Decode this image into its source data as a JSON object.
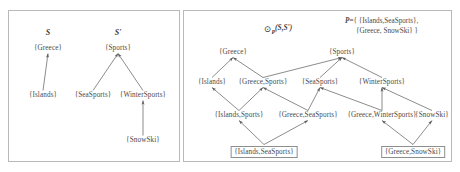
{
  "figure": {
    "type": "diagram",
    "left_panel": {
      "titles": [
        {
          "label": "S",
          "x": 48,
          "y": 28
        },
        {
          "label": "S'",
          "x": 118,
          "y": 28
        }
      ],
      "nodes": [
        {
          "id": "l-greece",
          "label": "{Greece}",
          "x": 48,
          "y": 45
        },
        {
          "id": "l-sports",
          "label": "{Sports}",
          "x": 118,
          "y": 45
        },
        {
          "id": "l-islands",
          "label": "{Islands}",
          "x": 43,
          "y": 92
        },
        {
          "id": "l-seasports",
          "label": "{SeaSports}",
          "x": 93,
          "y": 92
        },
        {
          "id": "l-wintersports",
          "label": "{WinterSports}",
          "x": 143,
          "y": 92
        },
        {
          "id": "l-snowski",
          "label": "{SnowSki}",
          "x": 143,
          "y": 137
        }
      ],
      "edges": [
        {
          "from": "l-islands",
          "to": "l-greece"
        },
        {
          "from": "l-seasports",
          "to": "l-sports"
        },
        {
          "from": "l-wintersports",
          "to": "l-sports"
        },
        {
          "from": "l-snowski",
          "to": "l-wintersports"
        }
      ]
    },
    "right_panel": {
      "operator": {
        "symbol": "⊙",
        "subscript": "P",
        "args": "(S,S')",
        "x": 278,
        "y": 23
      },
      "legend": {
        "name": "P",
        "equals": "=",
        "line1": "{ {Islands,SeaSports},",
        "line2": "{Greece, SnowSki} }",
        "x": 345,
        "y": 16
      },
      "nodes": [
        {
          "id": "r-greece",
          "label": "{Greece}",
          "x": 233,
          "y": 49,
          "boxed": false
        },
        {
          "id": "r-sports",
          "label": "{Sports}",
          "x": 342,
          "y": 49,
          "boxed": false
        },
        {
          "id": "r-islands",
          "label": "{Islands}",
          "x": 212,
          "y": 79,
          "boxed": false
        },
        {
          "id": "r-greece-sports",
          "label": "{Greece,Sports}",
          "x": 263,
          "y": 79,
          "boxed": false
        },
        {
          "id": "r-seasports",
          "label": "{SeaSports}",
          "x": 320,
          "y": 79,
          "boxed": false
        },
        {
          "id": "r-wintersports",
          "label": "{WinterSports}",
          "x": 382,
          "y": 79,
          "boxed": false
        },
        {
          "id": "r-islands-sports",
          "label": "{Islands,Sports}",
          "x": 239,
          "y": 112,
          "boxed": false
        },
        {
          "id": "r-greece-seasp",
          "label": "{Greece,SeaSports}",
          "x": 308,
          "y": 112,
          "boxed": false
        },
        {
          "id": "r-greece-winter",
          "label": "{Greece,WinterSports}",
          "x": 382,
          "y": 112,
          "boxed": false
        },
        {
          "id": "r-snowski",
          "label": "{SnowSki}",
          "x": 432,
          "y": 112,
          "boxed": false
        },
        {
          "id": "r-islands-seasp",
          "label": "{Islands,SeaSports}",
          "x": 264,
          "y": 146,
          "boxed": true
        },
        {
          "id": "r-greece-snowski",
          "label": "{Greece,SnowSki}",
          "x": 413,
          "y": 146,
          "boxed": true
        }
      ],
      "edges": [
        {
          "from": "r-islands",
          "to": "r-greece"
        },
        {
          "from": "r-greece-sports",
          "to": "r-greece"
        },
        {
          "from": "r-greece-sports",
          "to": "r-sports"
        },
        {
          "from": "r-seasports",
          "to": "r-sports"
        },
        {
          "from": "r-wintersports",
          "to": "r-sports"
        },
        {
          "from": "r-islands-sports",
          "to": "r-islands"
        },
        {
          "from": "r-islands-sports",
          "to": "r-greece-sports"
        },
        {
          "from": "r-greece-seasp",
          "to": "r-greece-sports"
        },
        {
          "from": "r-greece-seasp",
          "to": "r-seasports"
        },
        {
          "from": "r-greece-winter",
          "to": "r-seasports"
        },
        {
          "from": "r-greece-winter",
          "to": "r-wintersports"
        },
        {
          "from": "r-snowski",
          "to": "r-wintersports"
        },
        {
          "from": "r-islands-seasp",
          "to": "r-islands-sports"
        },
        {
          "from": "r-islands-seasp",
          "to": "r-greece-seasp"
        },
        {
          "from": "r-greece-snowski",
          "to": "r-greece-winter"
        },
        {
          "from": "r-greece-snowski",
          "to": "r-snowski"
        }
      ]
    }
  }
}
